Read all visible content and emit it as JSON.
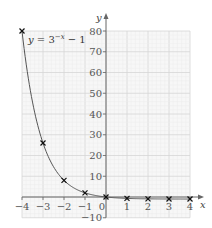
{
  "chart_data": {
    "type": "line",
    "title": "",
    "equation": {
      "prefix": "y",
      "equals": " = 3",
      "exponent": "−x",
      "suffix": " − 1"
    },
    "xlabel": "x",
    "ylabel": "y",
    "xlim": [
      -4,
      4
    ],
    "ylim": [
      -10,
      80
    ],
    "grid": true,
    "x_ticks": [
      -4,
      -3,
      -2,
      -1,
      0,
      1,
      2,
      3,
      4
    ],
    "x_tick_labels": [
      "−4",
      "−3",
      "−2",
      "−1",
      "0",
      "1",
      "2",
      "3",
      "4"
    ],
    "y_ticks": [
      -10,
      10,
      20,
      30,
      40,
      50,
      60,
      70,
      80
    ],
    "y_tick_labels": [
      "−10",
      "10",
      "20",
      "30",
      "40",
      "50",
      "60",
      "70",
      "80"
    ],
    "series": [
      {
        "name": "y = 3^(−x) − 1",
        "marker": "x",
        "x": [
          -4,
          -3,
          -2,
          -1,
          0,
          1,
          2,
          3,
          4
        ],
        "y": [
          80,
          26,
          8,
          2,
          0,
          -0.667,
          -0.889,
          -0.963,
          -0.988
        ]
      }
    ],
    "colors": {
      "curve": "#555555",
      "marker": "#111111",
      "axis": "#666666",
      "grid_major": "#d6d6d6",
      "grid_minor": "#ececec",
      "grid_bg": "#f7f7f7"
    }
  }
}
